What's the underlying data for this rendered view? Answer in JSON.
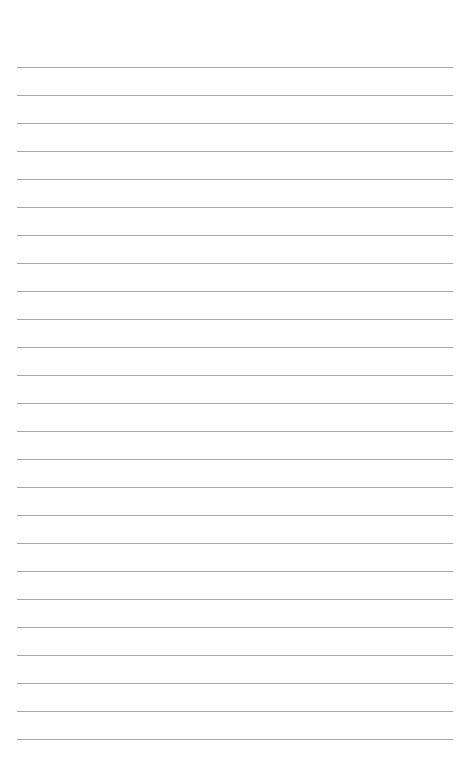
{
  "page": {
    "type": "lined-paper",
    "background_color": "#ffffff",
    "line_color": "#a8a8a8",
    "line_count": 25,
    "first_line_y": 67,
    "line_spacing": 28,
    "line_left": 17,
    "line_width": 436,
    "text": ""
  }
}
